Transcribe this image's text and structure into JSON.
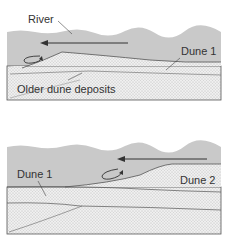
{
  "colors": {
    "water": "#c9c9c9",
    "sand": "#ececec",
    "line": "#444444",
    "text": "#333333"
  },
  "panels": [
    {
      "id": "top",
      "labels": {
        "river": "River",
        "dune1": "Dune 1",
        "older": "Older dune deposits"
      },
      "flow_direction": "left",
      "eddy": "recirculation-eddy"
    },
    {
      "id": "bottom",
      "labels": {
        "dune1": "Dune 1",
        "dune2": "Dune 2"
      },
      "flow_direction": "left",
      "eddy": "recirculation-eddy"
    }
  ]
}
